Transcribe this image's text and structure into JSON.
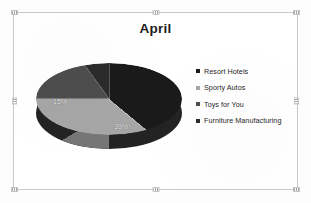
{
  "slide": {
    "title": "April",
    "background_color": "#ffffff",
    "border_color": "#c9c9c9"
  },
  "legend": {
    "position": "right",
    "items": [
      {
        "label": "Resort Hotels",
        "color": "#1a1a1a",
        "marker": "square-marker"
      },
      {
        "label": "Sporty Autos",
        "color": "#a6a6a6",
        "marker": "square-marker"
      },
      {
        "label": "Toys for You",
        "color": "#4d4d4d",
        "marker": "square-marker"
      },
      {
        "label": "Furniture Manufacturing",
        "color": "#2b2b2b",
        "marker": "square-marker"
      }
    ]
  },
  "labels": {
    "sporty_autos": "39%",
    "toys_for_you": "15%"
  },
  "chart_data": {
    "type": "pie",
    "title": "April",
    "three_d": true,
    "start_angle_deg": 0,
    "direction": "clockwise",
    "categories": [
      "Resort Hotels",
      "Sporty Autos",
      "Toys for You",
      "Furniture Manufacturing"
    ],
    "values": [
      36,
      39,
      15,
      10
    ],
    "value_unit": "percent",
    "data_labels": [
      "",
      "39%",
      "15%",
      ""
    ],
    "colors": [
      "#1a1a1a",
      "#a6a6a6",
      "#4d4d4d",
      "#2b2b2b"
    ],
    "legend_position": "right",
    "grid": false,
    "xlabel": "",
    "ylabel": ""
  }
}
